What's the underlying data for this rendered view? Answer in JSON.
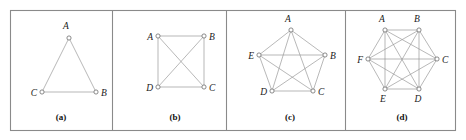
{
  "figure": {
    "background_color": "#ffffff",
    "frame_color": "#8a8a8a",
    "edge_color": "#9a9a9a",
    "node_fill": "#ffffff",
    "node_stroke": "#6d6d6d",
    "label_color": "#1a1a1a",
    "frame": {
      "x": 10.5,
      "y": 10.5,
      "width": 445,
      "height": 120
    },
    "dividers": [
      112,
      226,
      345
    ]
  },
  "panels": [
    {
      "id": "panel-a",
      "caption": "(a)",
      "caption_x": 61,
      "caption_y": 120,
      "graph_name": "K3",
      "vertex_count": 3,
      "edge_count": 3,
      "nodes": [
        {
          "label": "A",
          "x": 69,
          "y": 38,
          "label_x": 66,
          "label_y": 29,
          "anchor": "middle"
        },
        {
          "label": "B",
          "x": 96,
          "y": 92,
          "label_x": 101,
          "label_y": 96,
          "anchor": "start"
        },
        {
          "label": "C",
          "x": 42,
          "y": 92,
          "label_x": 37,
          "label_y": 96,
          "anchor": "end"
        }
      ],
      "edges": [
        [
          0,
          1
        ],
        [
          0,
          2
        ],
        [
          1,
          2
        ]
      ]
    },
    {
      "id": "panel-b",
      "caption": "(b)",
      "caption_x": 175,
      "caption_y": 120,
      "graph_name": "K4",
      "vertex_count": 4,
      "edge_count": 6,
      "nodes": [
        {
          "label": "A",
          "x": 158,
          "y": 36,
          "label_x": 153,
          "label_y": 40,
          "anchor": "end"
        },
        {
          "label": "B",
          "x": 204,
          "y": 36,
          "label_x": 209,
          "label_y": 40,
          "anchor": "start"
        },
        {
          "label": "C",
          "x": 204,
          "y": 87,
          "label_x": 209,
          "label_y": 91,
          "anchor": "start"
        },
        {
          "label": "D",
          "x": 158,
          "y": 87,
          "label_x": 153,
          "label_y": 91,
          "anchor": "end"
        }
      ],
      "edges": [
        [
          0,
          1
        ],
        [
          0,
          2
        ],
        [
          0,
          3
        ],
        [
          1,
          2
        ],
        [
          1,
          3
        ],
        [
          2,
          3
        ]
      ]
    },
    {
      "id": "panel-c",
      "caption": "(c)",
      "caption_x": 290,
      "caption_y": 120,
      "graph_name": "K5",
      "vertex_count": 5,
      "edge_count": 10,
      "nodes": [
        {
          "label": "A",
          "x": 291,
          "y": 30,
          "label_x": 288,
          "label_y": 22,
          "anchor": "middle"
        },
        {
          "label": "B",
          "x": 325,
          "y": 55,
          "label_x": 330,
          "label_y": 59,
          "anchor": "start"
        },
        {
          "label": "C",
          "x": 313,
          "y": 91,
          "label_x": 318,
          "label_y": 95,
          "anchor": "start"
        },
        {
          "label": "D",
          "x": 272,
          "y": 91,
          "label_x": 267,
          "label_y": 95,
          "anchor": "end"
        },
        {
          "label": "E",
          "x": 259,
          "y": 55,
          "label_x": 254,
          "label_y": 59,
          "anchor": "end"
        }
      ],
      "edges": [
        [
          0,
          1
        ],
        [
          0,
          2
        ],
        [
          0,
          3
        ],
        [
          0,
          4
        ],
        [
          1,
          2
        ],
        [
          1,
          3
        ],
        [
          1,
          4
        ],
        [
          2,
          3
        ],
        [
          2,
          4
        ],
        [
          3,
          4
        ]
      ]
    },
    {
      "id": "panel-d",
      "caption": "(d)",
      "caption_x": 402,
      "caption_y": 120,
      "graph_name": "K6",
      "vertex_count": 6,
      "edge_count": 15,
      "nodes": [
        {
          "label": "A",
          "x": 385,
          "y": 30,
          "label_x": 382,
          "label_y": 22,
          "anchor": "middle"
        },
        {
          "label": "B",
          "x": 419,
          "y": 30,
          "label_x": 417,
          "label_y": 22,
          "anchor": "middle"
        },
        {
          "label": "C",
          "x": 437,
          "y": 59,
          "label_x": 442,
          "label_y": 63,
          "anchor": "start"
        },
        {
          "label": "D",
          "x": 419,
          "y": 89,
          "label_x": 418,
          "label_y": 102,
          "anchor": "middle"
        },
        {
          "label": "E",
          "x": 385,
          "y": 89,
          "label_x": 383,
          "label_y": 102,
          "anchor": "middle"
        },
        {
          "label": "F",
          "x": 368,
          "y": 59,
          "label_x": 363,
          "label_y": 63,
          "anchor": "end"
        }
      ],
      "edges": [
        [
          0,
          1
        ],
        [
          0,
          2
        ],
        [
          0,
          3
        ],
        [
          0,
          4
        ],
        [
          0,
          5
        ],
        [
          1,
          2
        ],
        [
          1,
          3
        ],
        [
          1,
          4
        ],
        [
          1,
          5
        ],
        [
          2,
          3
        ],
        [
          2,
          4
        ],
        [
          2,
          5
        ],
        [
          3,
          4
        ],
        [
          3,
          5
        ],
        [
          4,
          5
        ]
      ]
    }
  ]
}
